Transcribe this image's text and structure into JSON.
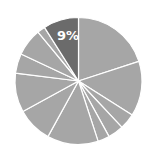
{
  "chart_data": {
    "type": "pie",
    "title": "",
    "start_angle_deg": 0,
    "direction": "clockwise",
    "center": [
      78.5,
      81
    ],
    "radius": 63.5,
    "categories": [
      "S1",
      "S2",
      "S3",
      "S4",
      "S5",
      "S6",
      "S7",
      "S8",
      "S9",
      "S10",
      "S11",
      "S12"
    ],
    "values": [
      20,
      14,
      4,
      4,
      3,
      13,
      9,
      10,
      5,
      7,
      2,
      9
    ],
    "highlight_index": 11,
    "labels": [
      {
        "index": 11,
        "text": "9%"
      }
    ],
    "colors": {
      "default": "#a6a6a6",
      "highlight": "#6b6b6b",
      "separator": "#ffffff",
      "label": "#ffffff"
    },
    "legend": null
  }
}
